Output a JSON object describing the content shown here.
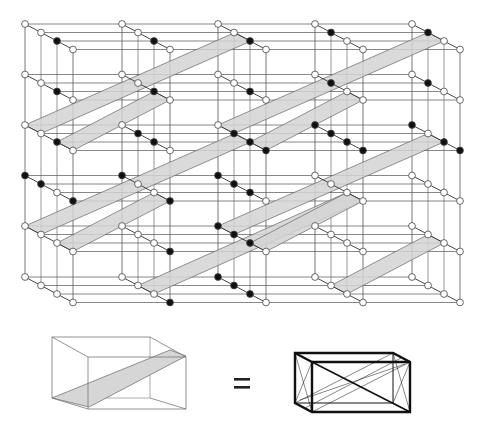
{
  "figure": {
    "colors": {
      "line": "#555555",
      "node_fill": "#111111",
      "node_hollow": "#ffffff",
      "band": "#d4d4d4",
      "band_edge": "#666666",
      "bold": "#111111"
    },
    "grid": {
      "column_x": [
        25,
        122,
        218,
        315,
        412
      ],
      "row_y": [
        24,
        74.5,
        125,
        175.5,
        226,
        277
      ],
      "chain_step": [
        16,
        8.5
      ],
      "chain_length": 4,
      "right_edge_x": 461
    },
    "nodes_filled": [
      [
        [
          0,
          0,
          1,
          0
        ],
        [
          0,
          0,
          1,
          0
        ],
        [
          0,
          0,
          1,
          0
        ],
        [
          0,
          1,
          0,
          0
        ],
        [
          0,
          1,
          0,
          0
        ]
      ],
      [
        [
          0,
          0,
          1,
          0
        ],
        [
          0,
          0,
          1,
          0
        ],
        [
          0,
          0,
          1,
          0
        ],
        [
          0,
          1,
          0,
          0
        ],
        [
          0,
          1,
          0,
          0
        ]
      ],
      [
        [
          0,
          0,
          1,
          0
        ],
        [
          0,
          1,
          1,
          0
        ],
        [
          0,
          1,
          1,
          1
        ],
        [
          1,
          1,
          1,
          1
        ],
        [
          1,
          0,
          1,
          1
        ]
      ],
      [
        [
          1,
          1,
          0,
          1
        ],
        [
          1,
          0,
          0,
          1
        ],
        [
          1,
          1,
          1,
          0
        ],
        [
          0,
          0,
          0,
          0
        ],
        [
          0,
          0,
          0,
          0
        ]
      ],
      [
        [
          0,
          0,
          0,
          0
        ],
        [
          0,
          0,
          0,
          1
        ],
        [
          1,
          1,
          1,
          0
        ],
        [
          0,
          0,
          0,
          0
        ],
        [
          0,
          0,
          0,
          0
        ]
      ],
      [
        [
          0,
          0,
          0,
          0
        ],
        [
          0,
          0,
          0,
          1
        ],
        [
          1,
          1,
          1,
          0
        ],
        [
          0,
          0,
          0,
          0
        ],
        [
          0,
          0,
          0,
          0
        ]
      ]
    ],
    "bands": [
      [
        [
          25,
          125
        ],
        [
          41,
          133.5
        ],
        [
          251,
          41
        ],
        [
          235,
          32.5
        ]
      ],
      [
        [
          57,
          142
        ],
        [
          73,
          150.5
        ],
        [
          170,
          100
        ],
        [
          154,
          91.5
        ]
      ],
      [
        [
          218,
          125
        ],
        [
          234,
          133.5
        ],
        [
          444,
          41
        ],
        [
          428,
          32.5
        ]
      ],
      [
        [
          250,
          142
        ],
        [
          266,
          150.5
        ],
        [
          363,
          100
        ],
        [
          347,
          91.5
        ]
      ],
      [
        [
          25,
          226
        ],
        [
          41,
          234.5
        ],
        [
          251,
          142
        ],
        [
          235,
          133.5
        ]
      ],
      [
        [
          57,
          243
        ],
        [
          73,
          251.5
        ],
        [
          170,
          201
        ],
        [
          154,
          192.5
        ]
      ],
      [
        [
          138,
          285.5
        ],
        [
          154,
          294
        ],
        [
          363,
          201
        ],
        [
          347,
          192.5
        ]
      ],
      [
        [
          218,
          226
        ],
        [
          234,
          234.5
        ],
        [
          444,
          142
        ],
        [
          428,
          133.5
        ]
      ],
      [
        [
          250,
          243
        ],
        [
          266,
          251.5
        ],
        [
          363,
          201
        ],
        [
          347,
          192.5
        ]
      ],
      [
        [
          331,
          285.5
        ],
        [
          347,
          294
        ],
        [
          444,
          243
        ],
        [
          428,
          234.5
        ]
      ]
    ],
    "legend": {
      "equals_sign": "=",
      "left_box": {
        "front": [
          72,
          352,
          172,
          402
        ],
        "back_offset": [
          -20,
          -10
        ]
      },
      "right_box": {
        "front": [
          314,
          352,
          410,
          405
        ],
        "back_offset": [
          -18,
          -9
        ]
      }
    }
  }
}
